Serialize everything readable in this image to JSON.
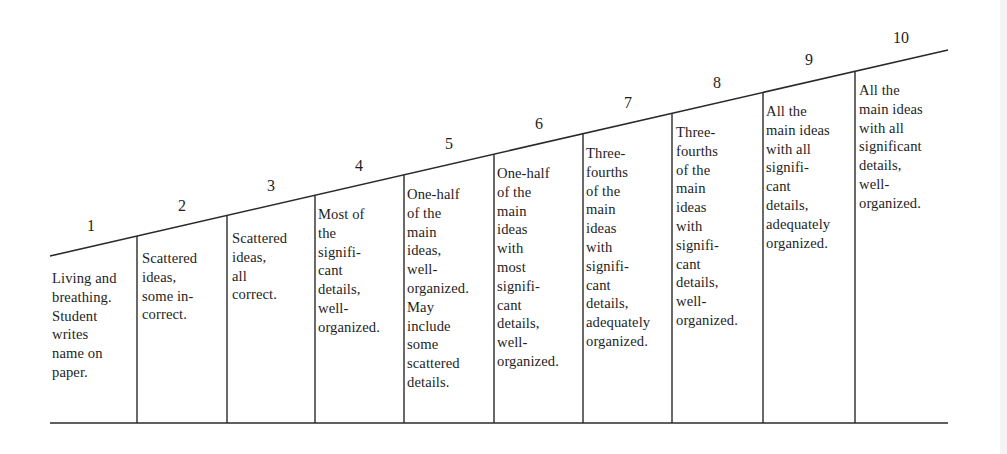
{
  "scale": {
    "levels": [
      {
        "number": "1",
        "description": "Living and\nbreathing.\nStudent\nwrites\nname on\npaper."
      },
      {
        "number": "2",
        "description": "Scattered\nideas,\nsome in-\ncorrect."
      },
      {
        "number": "3",
        "description": "Scattered\nideas,\nall\ncorrect."
      },
      {
        "number": "4",
        "description": "Most of\nthe\nsignifi-\ncant\ndetails,\nwell-\norganized."
      },
      {
        "number": "5",
        "description": "One-half\nof the\nmain\nideas,\nwell-\norganized.\nMay\ninclude\nsome\nscattered\ndetails."
      },
      {
        "number": "6",
        "description": "One-half\nof the\nmain\nideas\nwith\nmost\nsignifi-\ncant\ndetails,\nwell-\norganized."
      },
      {
        "number": "7",
        "description": "Three-\nfourths\nof the\nmain\nideas\nwith\nsignifi-\ncant\ndetails,\nadequately\norganized."
      },
      {
        "number": "8",
        "description": "Three-\nfourths\nof the\nmain\nideas\nwith\nsignifi-\ncant\ndetails,\nwell-\norganized."
      },
      {
        "number": "9",
        "description": "All the\nmain ideas\nwith all\nsignifi-\ncant\ndetails,\nadequately\norganized."
      },
      {
        "number": "10",
        "description": "All the\nmain ideas\nwith all\nsignificant\ndetails,\nwell-\norganized."
      }
    ]
  },
  "colors": {
    "ink": "#1e1e1e",
    "paper": "#ffffff"
  }
}
